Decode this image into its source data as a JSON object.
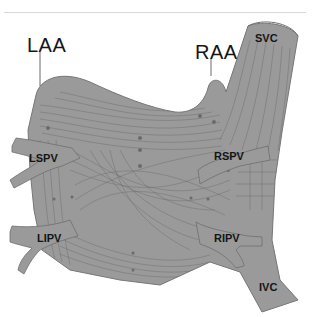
{
  "figure": {
    "colors": {
      "tissue_fill": "#9a9a9a",
      "tissue_stroke": "#6e6e6e",
      "fiber_lines": "#5c5c5c",
      "label_text": "#151515",
      "background": "#ffffff"
    },
    "labels": {
      "laa": "LAA",
      "raa": "RAA",
      "svc": "SVC",
      "ivc": "IVC",
      "lspv": "LSPV",
      "lipv": "LIPV",
      "rspv": "RSPV",
      "ripv": "RIPV"
    }
  }
}
